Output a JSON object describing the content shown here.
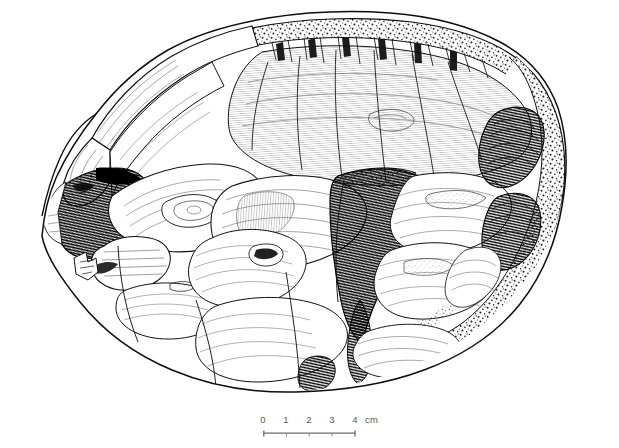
{
  "figure": {
    "domain": "archaeological-illustration",
    "view": "dorsal surface / flaking surface",
    "background_color": "#ffffff",
    "ink_color": "#1a1a1a",
    "paper_tone": "#ffffff",
    "caption": ""
  },
  "scale": {
    "ticks": [
      {
        "label": "0",
        "cm": 0
      },
      {
        "label": "1",
        "cm": 1
      },
      {
        "label": "2",
        "cm": 2
      },
      {
        "label": "3",
        "cm": 3
      },
      {
        "label": "4",
        "cm": 4
      }
    ],
    "unit_label": "cm",
    "full_label": "0 1 2 3 4 cm",
    "length_cm": 4,
    "bar_color": "#6b6b6b",
    "text_color": "#5a5a5a"
  },
  "artifact": {
    "outline_name": "core-outline",
    "regions": [
      {
        "name": "striking-platform-edge",
        "texture": "stippled-cortex",
        "position": "top"
      },
      {
        "name": "dorsal-flake-scars",
        "texture": "ripple-hatching",
        "position": "center"
      },
      {
        "name": "deep-negative-scar",
        "texture": "dense-hatching",
        "position": "center-right",
        "tone": "dark"
      },
      {
        "name": "left-negative-scar",
        "texture": "dense-hatching",
        "position": "left",
        "tone": "dark"
      },
      {
        "name": "cortex-band",
        "texture": "stippled-cortex",
        "position": "right-edge"
      },
      {
        "name": "lower-flake-scars",
        "texture": "ripple-hatching",
        "position": "bottom"
      },
      {
        "name": "distal-tip",
        "texture": "fine-hatching",
        "position": "left-tip"
      }
    ]
  }
}
